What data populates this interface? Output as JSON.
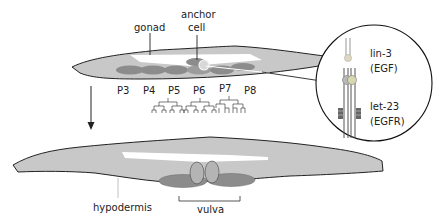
{
  "diagram": {
    "labels": {
      "gonad": "gonad",
      "anchor_cell_line1": "anchor",
      "anchor_cell_line2": "cell",
      "hypodermis": "hypodermis",
      "vulva": "vulva"
    },
    "vpc_labels": [
      "P3",
      "P4",
      "P5",
      "P6",
      "P7",
      "P8"
    ],
    "inset": {
      "ligand_name": "lin-3",
      "ligand_type": "(EGF)",
      "receptor_name": "let-23",
      "receptor_type": "(EGFR)"
    },
    "colors": {
      "body_fill": "#c8c8c8",
      "gonad_fill": "#ffffff",
      "vpc_fill": "#8c8c8c",
      "outline": "#222222",
      "vulva_cell_fill": "#b4b4b4"
    }
  }
}
